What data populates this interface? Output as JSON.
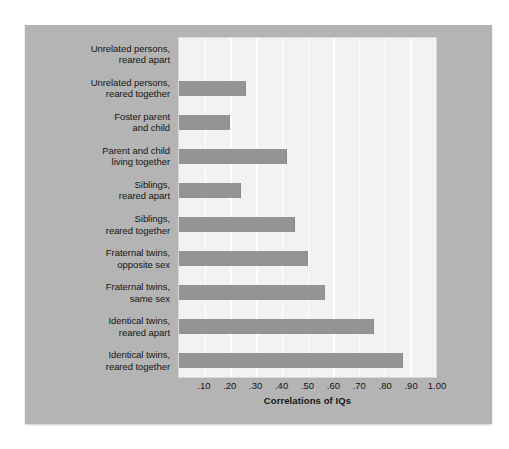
{
  "chart_data": {
    "type": "bar",
    "orientation": "horizontal",
    "title": "",
    "xlabel": "Correlations of IQs",
    "ylabel": "",
    "xlim": [
      0,
      1.0
    ],
    "xticks": [
      0.1,
      0.2,
      0.3,
      0.4,
      0.5,
      0.6,
      0.7,
      0.8,
      0.9,
      1.0
    ],
    "xtick_labels": [
      ".10",
      ".20",
      ".30",
      ".40",
      ".50",
      ".60",
      ".70",
      ".80",
      ".90",
      "1.00"
    ],
    "grid": true,
    "grid_axis": "x",
    "legend": false,
    "categories": [
      "Unrelated persons, reared apart",
      "Unrelated persons, reared together",
      "Foster parent and child",
      "Parent and child living together",
      "Siblings, reared apart",
      "Siblings, reared together",
      "Fraternal twins, opposite sex",
      "Fraternal twins, same sex",
      "Identical twins, reared apart",
      "Identical twins, reared together"
    ],
    "category_lines": [
      [
        "Unrelated persons,",
        "reared apart"
      ],
      [
        "Unrelated persons,",
        "reared together"
      ],
      [
        "Foster parent",
        "and child"
      ],
      [
        "Parent and child",
        "living together"
      ],
      [
        "Siblings,",
        "reared apart"
      ],
      [
        "Siblings,",
        "reared together"
      ],
      [
        "Fraternal twins,",
        "opposite sex"
      ],
      [
        "Fraternal twins,",
        "same sex"
      ],
      [
        "Identical twins,",
        "reared apart"
      ],
      [
        "Identical twins,",
        "reared together"
      ]
    ],
    "values": [
      0.0,
      0.26,
      0.2,
      0.42,
      0.24,
      0.45,
      0.5,
      0.57,
      0.76,
      0.87
    ]
  },
  "colors": {
    "panel_background": "#b4b4b4",
    "plot_background": "#f2f2f2",
    "bar_fill": "#949494",
    "gridline": "#ffffff",
    "text": "#141414",
    "page_background": "#ffffff"
  }
}
